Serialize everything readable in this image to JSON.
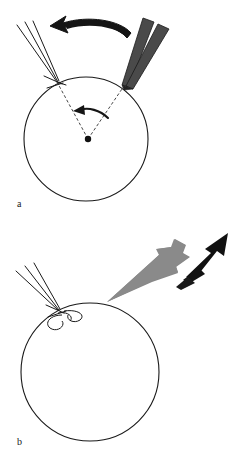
{
  "figure": {
    "type": "scientific-diagram",
    "background_color": "#ffffff",
    "width": 238,
    "height": 464
  },
  "panels": [
    {
      "id": "a",
      "label": "a",
      "label_position": {
        "x": 17,
        "y": 199
      },
      "sphere": {
        "name": "circle-a",
        "center": {
          "x": 86,
          "y": 139
        },
        "radius": 62,
        "stroke": "#1a1a1a",
        "stroke_width": 1,
        "fill": "none"
      },
      "center_dot": {
        "name": "sphere-center-dot",
        "x": 88,
        "y": 139,
        "radius": 3,
        "color": "#111111"
      },
      "thin_beam": {
        "name": "thin-beam-left",
        "line_count": 3,
        "color": "#1a1a1a",
        "stroke_width": 1,
        "impact_point": {
          "x": 57,
          "y": 82
        },
        "origin_spread": [
          {
            "x": 17,
            "y": 25
          },
          {
            "x": 25,
            "y": 22
          },
          {
            "x": 33,
            "y": 21
          }
        ]
      },
      "thick_beam": {
        "name": "thick-beam-right",
        "bar_count": 2,
        "fill": "#4a4a4a",
        "stroke": "#1a1a1a",
        "impact_point": {
          "x": 124,
          "y": 86
        },
        "angle_label": ""
      },
      "curved_arrow": {
        "name": "rotation-arrow-large",
        "direction": "left",
        "color": "#111111",
        "from": {
          "x": 131,
          "y": 31
        },
        "to": {
          "x": 56,
          "y": 24
        }
      },
      "angle_arc_arrow": {
        "name": "rotation-arrow-small",
        "direction": "left",
        "color": "#111111",
        "from": {
          "x": 106,
          "y": 116
        },
        "to": {
          "x": 80,
          "y": 112
        }
      },
      "dashed_radii": {
        "name": "dashed-radius-lines",
        "color": "#333333",
        "dash_pattern": "3,2",
        "lines": [
          {
            "from": {
              "x": 88,
              "y": 139
            },
            "to": {
              "x": 57,
              "y": 82
            }
          },
          {
            "from": {
              "x": 88,
              "y": 139
            },
            "to": {
              "x": 124,
              "y": 86
            }
          }
        ]
      }
    },
    {
      "id": "b",
      "label": "b",
      "label_position": {
        "x": 17,
        "y": 437
      },
      "sphere": {
        "name": "circle-b",
        "center": {
          "x": 90,
          "y": 372
        },
        "radius": 69,
        "stroke": "#1a1a1a",
        "stroke_width": 1,
        "fill": "none"
      },
      "thin_beam": {
        "name": "thin-beam-left",
        "line_count": 3,
        "color": "#1a1a1a",
        "stroke_width": 1,
        "impact_point": {
          "x": 58,
          "y": 310
        },
        "origin_spread": [
          {
            "x": 16,
            "y": 271
          },
          {
            "x": 25,
            "y": 266
          },
          {
            "x": 34,
            "y": 263
          }
        ]
      },
      "curls": {
        "name": "scatter-curl-loops",
        "count": 2,
        "color": "#1a1a1a",
        "positions": [
          {
            "x": 56,
            "y": 320
          },
          {
            "x": 68,
            "y": 313
          }
        ]
      },
      "gray_plume": {
        "name": "gray-ejecta-plume",
        "fill": "#888888",
        "tip": {
          "x": 107,
          "y": 302
        },
        "direction": "up-right"
      },
      "black_arrow": {
        "name": "ejecta-direction-arrow",
        "fill": "#111111",
        "direction": "up-right",
        "tip": {
          "x": 228,
          "y": 233
        }
      }
    }
  ]
}
